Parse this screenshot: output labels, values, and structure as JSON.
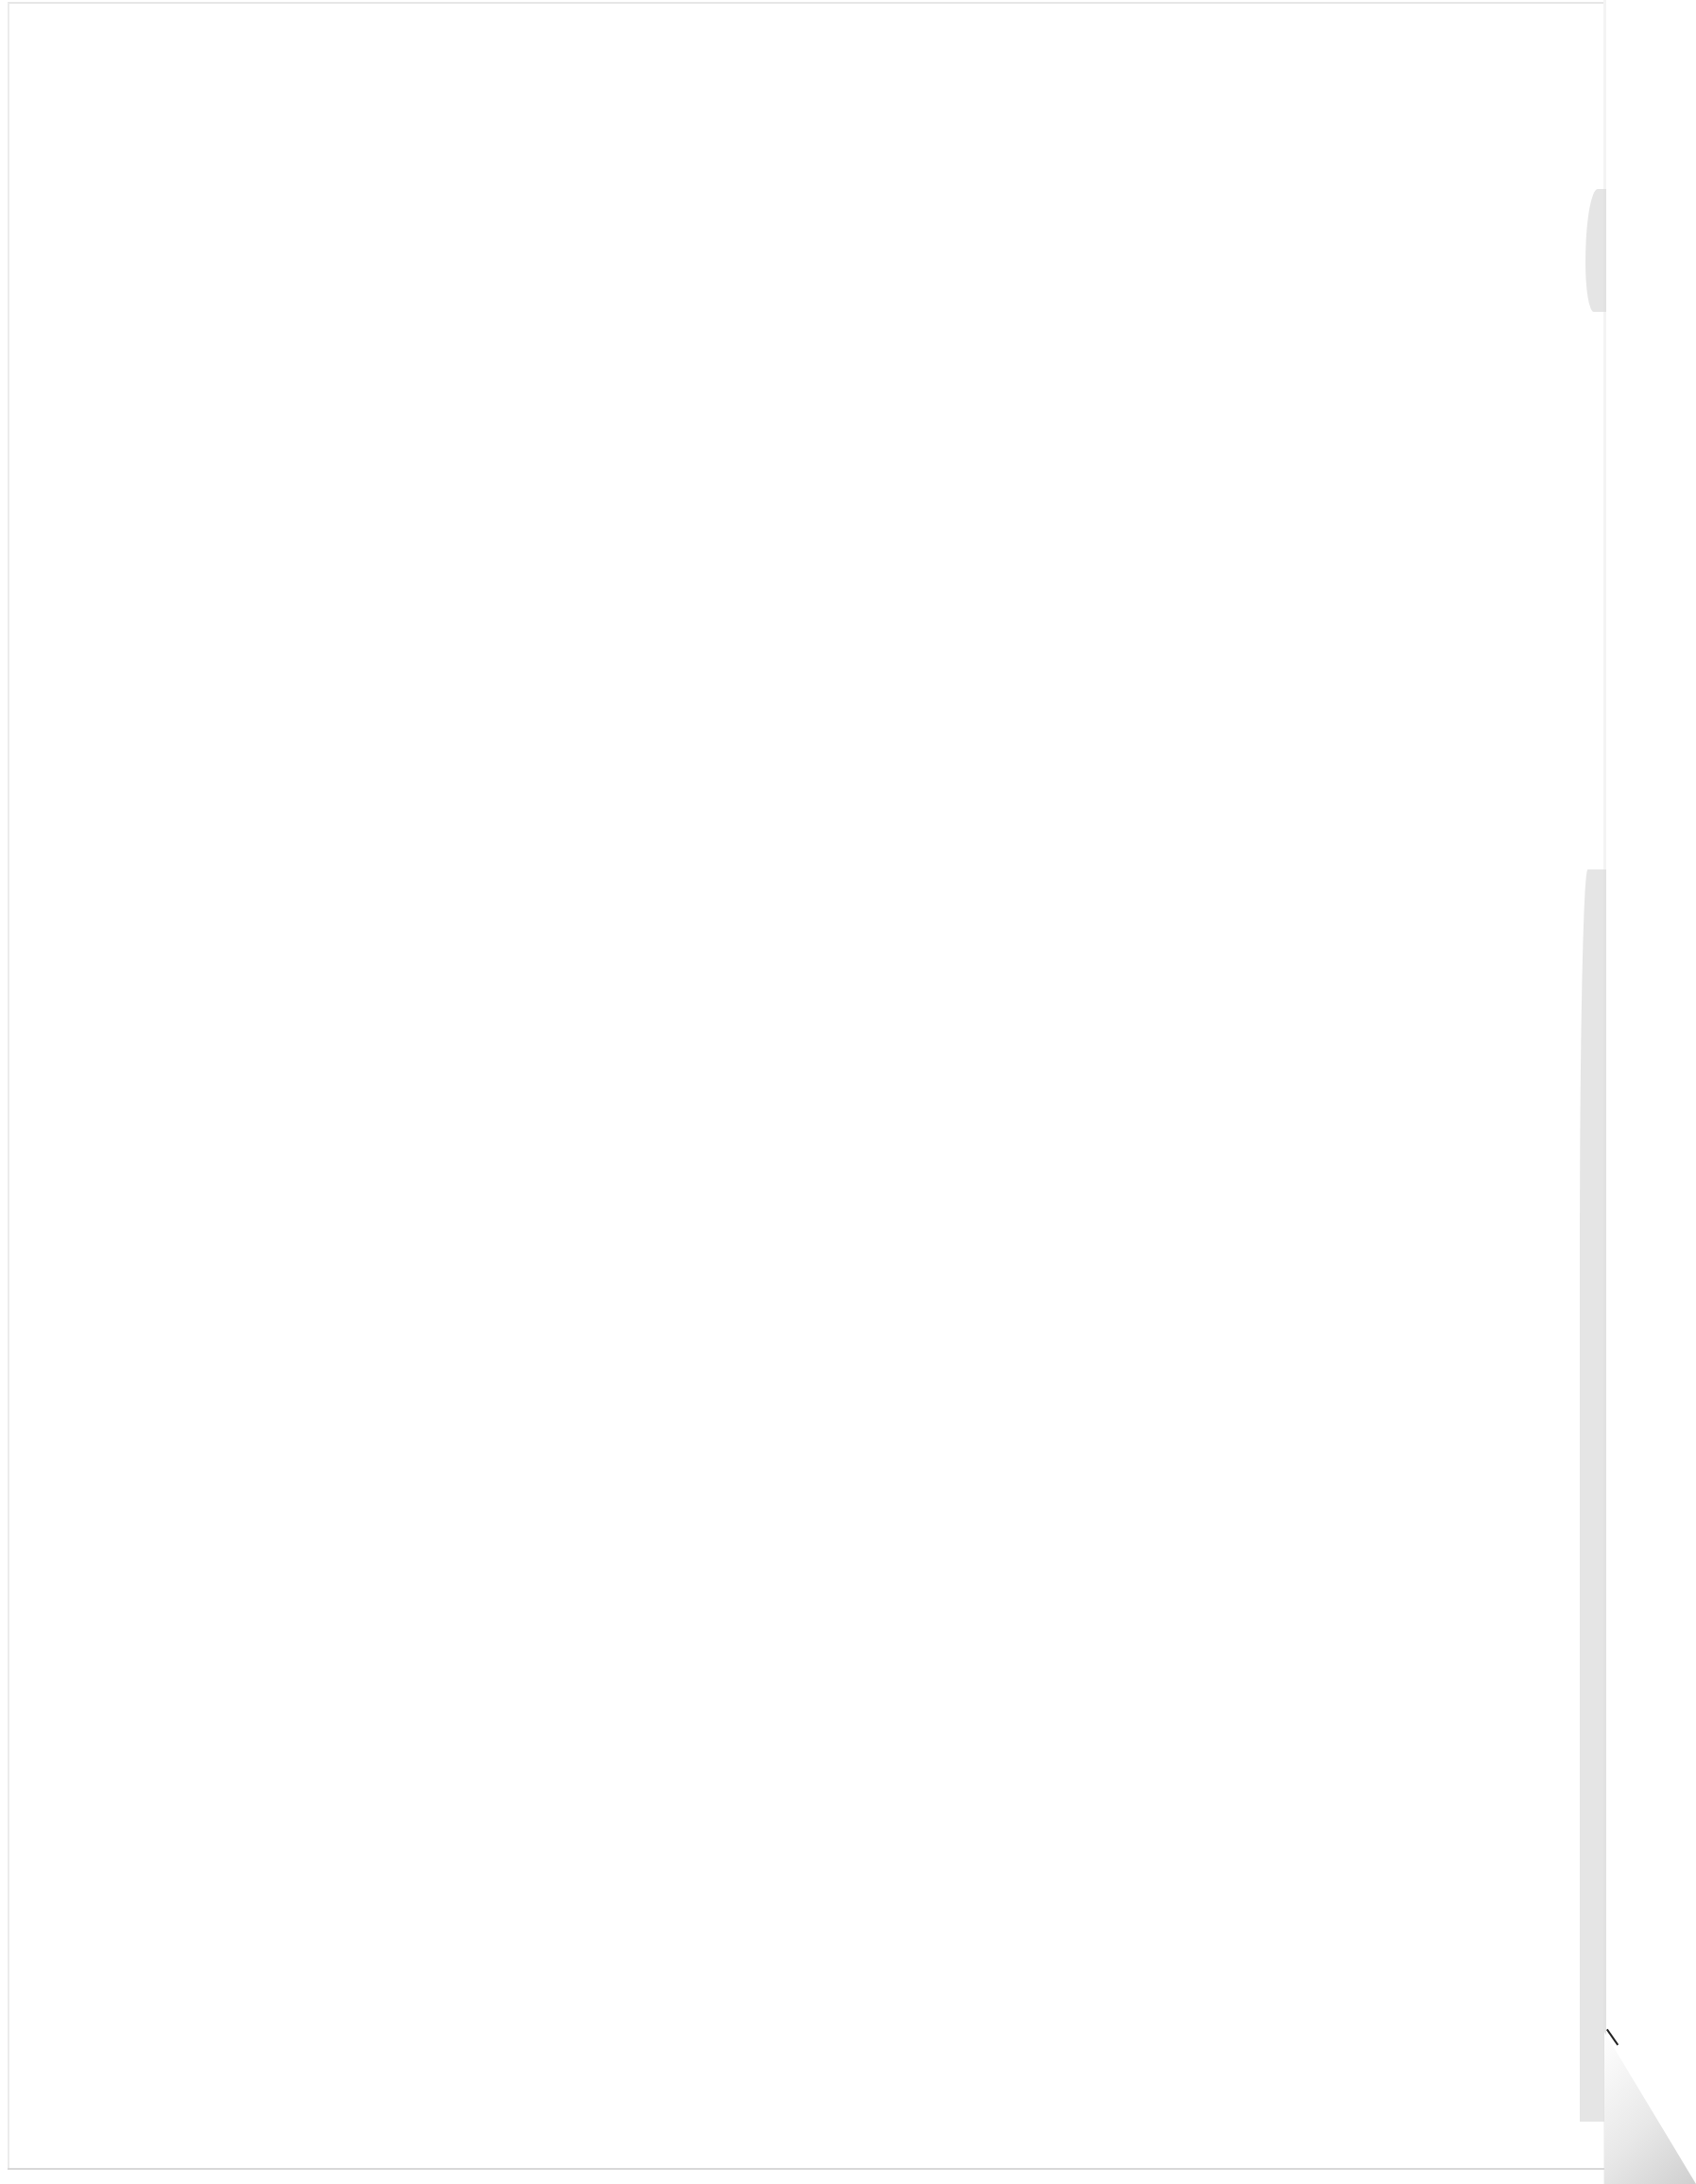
{
  "document": {
    "type": "scanned-page",
    "content": "",
    "page_blank": true
  },
  "colors": {
    "paper": "#ffffff",
    "edge_shadow": "#dcdcdc"
  }
}
